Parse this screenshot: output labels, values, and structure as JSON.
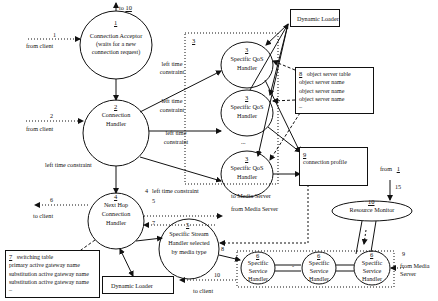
{
  "diagram": {
    "type": "architecture-flow",
    "nodes": {
      "connection_acceptor": {
        "id": "1",
        "title": "Connection Acceptor",
        "subtitle_1": "(waits for a new",
        "subtitle_2": "connection request)"
      },
      "connection_handler": {
        "id": "2",
        "title_1": "Connection",
        "title_2": "Handler"
      },
      "qos_group": {
        "id": "3"
      },
      "qos_handler_1": {
        "id": "3",
        "title_1": "Specific QoS",
        "title_2": "Handler"
      },
      "qos_handler_2": {
        "id": "3",
        "title_1": "Specific QoS",
        "title_2": "Handler"
      },
      "qos_handler_3": {
        "id": "3",
        "title_1": "Specific QoS",
        "title_2": "Handler"
      },
      "qos_ellipsis": "...",
      "next_hop_handler": {
        "id": "4",
        "title_1": "Next Hop",
        "title_2": "Connection",
        "title_3": "Handler"
      },
      "stream_handler": {
        "id": "5",
        "title_1": "Specific Stream",
        "title_2": "Handler selected",
        "title_3": "by media type"
      },
      "service_handler_1": {
        "id": "6",
        "title_1": "Specific",
        "title_2": "Service",
        "title_3": "Handler"
      },
      "service_handler_2": {
        "id": "6",
        "title_1": "Specific",
        "title_2": "Service",
        "title_3": "Handler"
      },
      "service_handler_3": {
        "id": "6",
        "title_1": "Specific",
        "title_2": "Service",
        "title_3": "Handler"
      },
      "service_dash": "-",
      "switching_table": {
        "id": "7",
        "title": "switching table",
        "rows": [
          "primary active gateway name",
          "substitution active gateway name",
          "substitution active gateway name",
          "–"
        ]
      },
      "object_server_table": {
        "id": "8",
        "title": "object server table",
        "rows": [
          "object server name",
          "object server name",
          "object server name",
          "–"
        ]
      },
      "connection_profile": {
        "id": "9",
        "title": "connection profile"
      },
      "resource_monitor": {
        "id": "10",
        "title": "Resource Monitor"
      },
      "dynamic_loader_top": {
        "title": "Dynamic Loader"
      },
      "dynamic_loader_bottom": {
        "title": "Dynamic Loader"
      }
    },
    "edge_labels": {
      "to_10": {
        "prefix": "to",
        "num": "10"
      },
      "from_client_1": {
        "num": "1",
        "text": "from client"
      },
      "from_client_2": {
        "num": "2",
        "text": "from client"
      },
      "left_time_constraint_main": "left time constraint",
      "ltc_a1": "left time",
      "ltc_a2": "constraint",
      "ltc_b1": "left time",
      "ltc_b2": "constraint",
      "ltc_c1": "left time",
      "ltc_c2": "constraint",
      "ltc_4": {
        "num": "4",
        "text": "left time constraint"
      },
      "to_media_server": "to Media Server",
      "from_media_server_5": {
        "num": "5",
        "text": "from Media Server"
      },
      "to_client_6": {
        "num": "6",
        "text": "to client"
      },
      "edge_7": "7",
      "edge_8": "8",
      "from_media_server_9": {
        "num": "9",
        "text_1": "from Media",
        "text_2": "Server"
      },
      "to_client_10": {
        "num": "10",
        "text": "to client"
      },
      "from_1": {
        "prefix": "from",
        "num": "1"
      },
      "edge_15": "15"
    },
    "colors": {
      "stroke": "#111111",
      "background": "#ffffff"
    }
  }
}
